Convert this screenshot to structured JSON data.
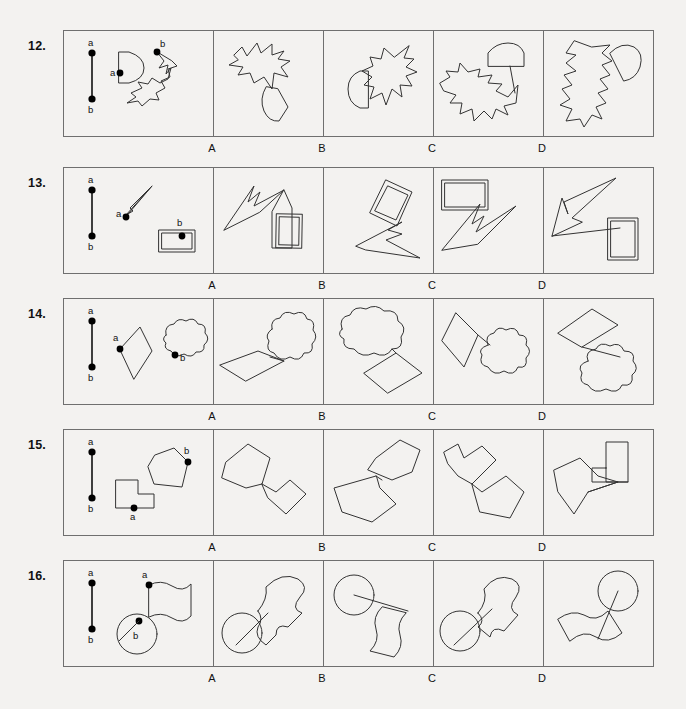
{
  "document": {
    "type": "spatial-reasoning-test",
    "option_labels": [
      "A",
      "B",
      "C",
      "D"
    ],
    "reference_point_labels": {
      "top": "a",
      "bottom": "b"
    }
  },
  "rows": [
    {
      "number": "12.",
      "top": 30,
      "prompt": {
        "point_a_label": "a",
        "point_b_label": "b",
        "shape1": "half-disc",
        "shape2": "star-blob"
      },
      "options": [
        {
          "label": "A"
        },
        {
          "label": "B"
        },
        {
          "label": "C"
        },
        {
          "label": "D"
        }
      ]
    },
    {
      "number": "13.",
      "top": 167,
      "prompt": {
        "point_a_label": "a",
        "point_b_label": "b",
        "shape1": "lightning-arrow",
        "shape2": "double-rectangle"
      },
      "options": [
        {
          "label": "A"
        },
        {
          "label": "B"
        },
        {
          "label": "C"
        },
        {
          "label": "D"
        }
      ]
    },
    {
      "number": "14.",
      "top": 298,
      "prompt": {
        "point_a_label": "a",
        "point_b_label": "b",
        "shape1": "diamond",
        "shape2": "cloud"
      },
      "options": [
        {
          "label": "A"
        },
        {
          "label": "B"
        },
        {
          "label": "C"
        },
        {
          "label": "D"
        }
      ]
    },
    {
      "number": "15.",
      "top": 429,
      "prompt": {
        "point_a_label": "a",
        "point_b_label": "b",
        "shape1": "L-block",
        "shape2": "pentagon"
      },
      "options": [
        {
          "label": "A"
        },
        {
          "label": "B"
        },
        {
          "label": "C"
        },
        {
          "label": "D"
        }
      ]
    },
    {
      "number": "16.",
      "top": 560,
      "prompt": {
        "point_a_label": "a",
        "point_b_label": "b",
        "shape1": "circle",
        "shape2": "wavy-flag"
      },
      "options": [
        {
          "label": "A"
        },
        {
          "label": "B"
        },
        {
          "label": "C"
        },
        {
          "label": "D"
        }
      ]
    }
  ],
  "geometry": {
    "strip_left": 63,
    "strip_right": 654,
    "prompt_panel_width": 149,
    "option_panel_width": 110,
    "panel_height": 105
  },
  "colors": {
    "background": "#f3f2f0",
    "border": "#6f6f6f",
    "ink": "#333333",
    "text": "#111111"
  }
}
